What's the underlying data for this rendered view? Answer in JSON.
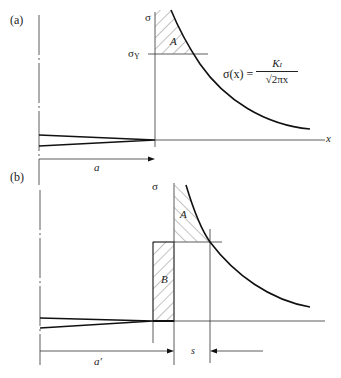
{
  "panel_a": {
    "label": "(a)",
    "sigma_axis_label": "σ",
    "yield_label": "σ",
    "yield_sub": "Y",
    "area_label": "A",
    "x_axis_label": "x",
    "crack_length_label": "a",
    "equation": {
      "lhs": "σ(x) =",
      "numerator": "K",
      "numerator_sub": "I",
      "denominator": "√2πx"
    }
  },
  "panel_b": {
    "label": "(b)",
    "sigma_axis_label": "σ",
    "area_a_label": "A",
    "area_b_label": "B",
    "crack_length_label": "a′",
    "plastic_zone_label": "s"
  },
  "colors": {
    "line": "#222222",
    "hatch": "#555555"
  }
}
